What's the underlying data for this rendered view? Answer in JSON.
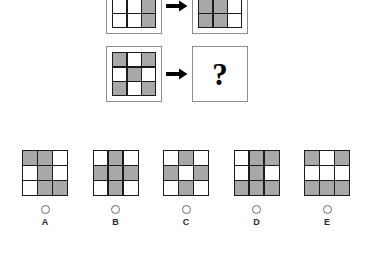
{
  "puzzle": {
    "type": "matrix-reasoning",
    "cell_colors": {
      "gray": "#a8a8a8",
      "white": "#ffffff",
      "grid_line": "#1b1b1b",
      "panel_border": "#8d8d8d"
    },
    "arrow_glyph": "right-arrow",
    "question_glyph": "?",
    "rows": [
      {
        "id": "row-1",
        "source": {
          "name": "row-1-source-grid",
          "cells": [
            "white",
            "gray",
            "white",
            "white",
            "white",
            "gray",
            "white",
            "white",
            "gray"
          ]
        },
        "result": {
          "name": "row-1-result-grid",
          "cells": [
            "gray",
            "white",
            "gray",
            "gray",
            "gray",
            "white",
            "gray",
            "gray",
            "white"
          ]
        }
      },
      {
        "id": "row-2",
        "source": {
          "name": "row-2-source-grid",
          "cells": [
            "gray",
            "white",
            "gray",
            "white",
            "gray",
            "white",
            "gray",
            "white",
            "gray"
          ]
        },
        "result": {
          "name": "row-2-result-unknown",
          "cells": null
        }
      }
    ],
    "options": [
      {
        "label": "A",
        "selected": false,
        "cells": [
          "gray",
          "gray",
          "white",
          "white",
          "gray",
          "white",
          "white",
          "gray",
          "gray"
        ]
      },
      {
        "label": "B",
        "selected": false,
        "cells": [
          "white",
          "gray",
          "white",
          "gray",
          "gray",
          "gray",
          "white",
          "gray",
          "white"
        ]
      },
      {
        "label": "C",
        "selected": false,
        "cells": [
          "white",
          "gray",
          "white",
          "gray",
          "white",
          "gray",
          "white",
          "gray",
          "white"
        ]
      },
      {
        "label": "D",
        "selected": false,
        "cells": [
          "white",
          "gray",
          "gray",
          "white",
          "gray",
          "white",
          "gray",
          "gray",
          "gray"
        ]
      },
      {
        "label": "E",
        "selected": false,
        "cells": [
          "gray",
          "white",
          "gray",
          "white",
          "white",
          "white",
          "gray",
          "gray",
          "gray"
        ]
      }
    ]
  }
}
